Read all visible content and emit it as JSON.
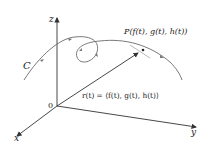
{
  "diagram": {
    "title": "",
    "axes": {
      "z_label": "z",
      "x_label": "x",
      "y_label": "y",
      "origin_label": "0"
    },
    "curve_label": "C",
    "point_label": "P(f(t), g(t), h(t))",
    "vector_label": "r(t) = ⟨f(t), g(t), h(t)⟩",
    "colors": {
      "axis": "#333333",
      "curve": "#6a6a6a",
      "text": "#222222"
    }
  }
}
